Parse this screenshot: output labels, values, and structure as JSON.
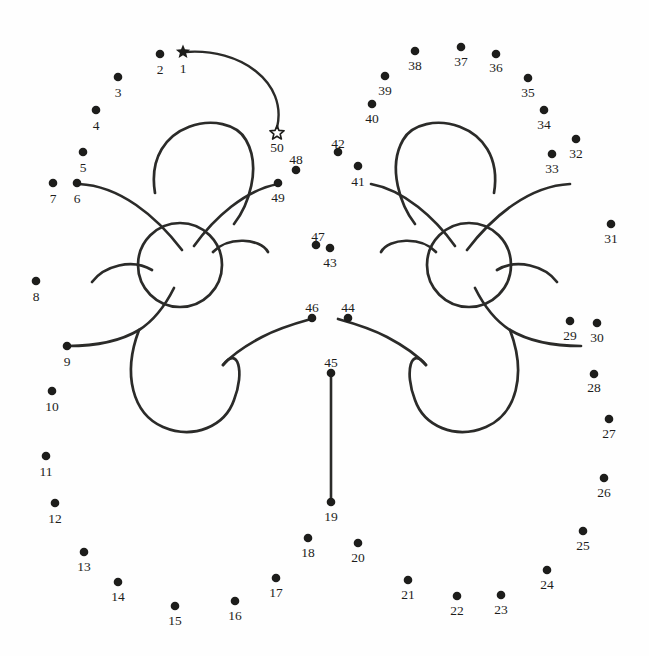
{
  "page": {
    "background_color": "#fefefe",
    "ink_color": "#1d1d1b",
    "stroke_color": "#2b2b29",
    "width": 649,
    "height": 656
  },
  "puzzle": {
    "start_marker": "filled-star",
    "end_marker": "open-star",
    "start_number": "1",
    "end_number": "50",
    "total_dots": 50,
    "dots": [
      {
        "n": "1",
        "x": 183,
        "y": 52,
        "marker": "filled-star",
        "lx": 183,
        "ly": 73
      },
      {
        "n": "2",
        "x": 160,
        "y": 54,
        "marker": "dot",
        "lx": 160,
        "ly": 74
      },
      {
        "n": "3",
        "x": 118,
        "y": 77,
        "marker": "dot",
        "lx": 118,
        "ly": 97
      },
      {
        "n": "4",
        "x": 96,
        "y": 110,
        "marker": "dot",
        "lx": 96,
        "ly": 130
      },
      {
        "n": "5",
        "x": 83,
        "y": 152,
        "marker": "dot",
        "lx": 83,
        "ly": 172
      },
      {
        "n": "6",
        "x": 77,
        "y": 183,
        "marker": "dot",
        "lx": 77,
        "ly": 203
      },
      {
        "n": "7",
        "x": 53,
        "y": 183,
        "marker": "dot",
        "lx": 53,
        "ly": 203
      },
      {
        "n": "8",
        "x": 36,
        "y": 281,
        "marker": "dot",
        "lx": 36,
        "ly": 301
      },
      {
        "n": "9",
        "x": 67,
        "y": 346,
        "marker": "dot",
        "lx": 67,
        "ly": 366
      },
      {
        "n": "10",
        "x": 52,
        "y": 391,
        "marker": "dot",
        "lx": 52,
        "ly": 411
      },
      {
        "n": "11",
        "x": 46,
        "y": 456,
        "marker": "dot",
        "lx": 46,
        "ly": 476
      },
      {
        "n": "12",
        "x": 55,
        "y": 503,
        "marker": "dot",
        "lx": 55,
        "ly": 523
      },
      {
        "n": "13",
        "x": 84,
        "y": 552,
        "marker": "dot",
        "lx": 84,
        "ly": 571
      },
      {
        "n": "14",
        "x": 118,
        "y": 582,
        "marker": "dot",
        "lx": 118,
        "ly": 601
      },
      {
        "n": "15",
        "x": 175,
        "y": 606,
        "marker": "dot",
        "lx": 175,
        "ly": 625
      },
      {
        "n": "16",
        "x": 235,
        "y": 601,
        "marker": "dot",
        "lx": 235,
        "ly": 620
      },
      {
        "n": "17",
        "x": 276,
        "y": 578,
        "marker": "dot",
        "lx": 276,
        "ly": 597
      },
      {
        "n": "18",
        "x": 308,
        "y": 538,
        "marker": "dot",
        "lx": 308,
        "ly": 557
      },
      {
        "n": "19",
        "x": 331,
        "y": 502,
        "marker": "dot",
        "lx": 331,
        "ly": 521
      },
      {
        "n": "20",
        "x": 358,
        "y": 543,
        "marker": "dot",
        "lx": 358,
        "ly": 562
      },
      {
        "n": "21",
        "x": 408,
        "y": 580,
        "marker": "dot",
        "lx": 408,
        "ly": 599
      },
      {
        "n": "22",
        "x": 457,
        "y": 596,
        "marker": "dot",
        "lx": 457,
        "ly": 615
      },
      {
        "n": "23",
        "x": 501,
        "y": 595,
        "marker": "dot",
        "lx": 501,
        "ly": 614
      },
      {
        "n": "24",
        "x": 547,
        "y": 570,
        "marker": "dot",
        "lx": 547,
        "ly": 589
      },
      {
        "n": "25",
        "x": 583,
        "y": 531,
        "marker": "dot",
        "lx": 583,
        "ly": 550
      },
      {
        "n": "26",
        "x": 604,
        "y": 478,
        "marker": "dot",
        "lx": 604,
        "ly": 497
      },
      {
        "n": "27",
        "x": 609,
        "y": 419,
        "marker": "dot",
        "lx": 609,
        "ly": 438
      },
      {
        "n": "28",
        "x": 594,
        "y": 374,
        "marker": "dot",
        "lx": 594,
        "ly": 392
      },
      {
        "n": "29",
        "x": 570,
        "y": 321,
        "marker": "dot",
        "lx": 570,
        "ly": 340
      },
      {
        "n": "30",
        "x": 597,
        "y": 323,
        "marker": "dot",
        "lx": 597,
        "ly": 342
      },
      {
        "n": "31",
        "x": 611,
        "y": 224,
        "marker": "dot",
        "lx": 611,
        "ly": 243
      },
      {
        "n": "32",
        "x": 576,
        "y": 139,
        "marker": "dot",
        "lx": 576,
        "ly": 158
      },
      {
        "n": "33",
        "x": 552,
        "y": 154,
        "marker": "dot",
        "lx": 552,
        "ly": 173
      },
      {
        "n": "34",
        "x": 544,
        "y": 110,
        "marker": "dot",
        "lx": 544,
        "ly": 129
      },
      {
        "n": "35",
        "x": 528,
        "y": 78,
        "marker": "dot",
        "lx": 528,
        "ly": 97
      },
      {
        "n": "36",
        "x": 496,
        "y": 54,
        "marker": "dot",
        "lx": 496,
        "ly": 72
      },
      {
        "n": "37",
        "x": 461,
        "y": 47,
        "marker": "dot",
        "lx": 461,
        "ly": 66
      },
      {
        "n": "38",
        "x": 415,
        "y": 51,
        "marker": "dot",
        "lx": 415,
        "ly": 70
      },
      {
        "n": "39",
        "x": 385,
        "y": 76,
        "marker": "dot",
        "lx": 385,
        "ly": 95
      },
      {
        "n": "40",
        "x": 372,
        "y": 104,
        "marker": "dot",
        "lx": 372,
        "ly": 123
      },
      {
        "n": "41",
        "x": 358,
        "y": 166,
        "marker": "dot",
        "lx": 358,
        "ly": 186
      },
      {
        "n": "42",
        "x": 338,
        "y": 152,
        "marker": "dot",
        "lx": 338,
        "ly": 148
      },
      {
        "n": "43",
        "x": 330,
        "y": 248,
        "marker": "dot",
        "lx": 330,
        "ly": 267
      },
      {
        "n": "44",
        "x": 348,
        "y": 318,
        "marker": "dot",
        "lx": 348,
        "ly": 312
      },
      {
        "n": "45",
        "x": 331,
        "y": 373,
        "marker": "dot",
        "lx": 331,
        "ly": 367
      },
      {
        "n": "46",
        "x": 312,
        "y": 318,
        "marker": "dot",
        "lx": 312,
        "ly": 312
      },
      {
        "n": "47",
        "x": 316,
        "y": 245,
        "marker": "dot",
        "lx": 318,
        "ly": 241
      },
      {
        "n": "48",
        "x": 296,
        "y": 170,
        "marker": "dot",
        "lx": 296,
        "ly": 164
      },
      {
        "n": "49",
        "x": 278,
        "y": 183,
        "marker": "dot",
        "lx": 278,
        "ly": 202
      },
      {
        "n": "50",
        "x": 277,
        "y": 133,
        "marker": "open-star",
        "lx": 277,
        "ly": 152
      }
    ],
    "connector_line": {
      "from": "45",
      "to": "19",
      "x1": 331,
      "y1": 373,
      "x2": 331,
      "y2": 502
    },
    "guide_arc": "M186,52 C240,48 288,82 277,128",
    "figures": [
      {
        "name": "left-butterfly",
        "body_circle": {
          "cx": 180,
          "cy": 265,
          "r": 42
        },
        "paths": [
          "M155,193 C143,120 228,107 246,140 C262,168 248,206 234,224",
          "M79,184 C120,186 156,216 182,250",
          "M278,184 C245,190 214,218 194,246",
          "M68,346 C95,346 119,342 139,330 C158,318 168,300 174,288",
          "M311,319 C293,324 277,329 262,337 C245,346 232,355 223,365",
          "M139,330 C122,375 133,414 163,427 C194,440 225,426 234,400 C245,372 238,345 223,365",
          "M92,282 C104,266 132,258 152,270",
          "M268,252 C260,238 228,236 213,252"
        ]
      },
      {
        "name": "right-butterfly",
        "body_circle": {
          "cx": 469,
          "cy": 265,
          "r": 42
        },
        "paths": [
          "M494,193 C506,120 421,107 403,140 C387,168 401,206 415,224",
          "M570,184 C529,186 493,216 467,250",
          "M371,184 C404,190 435,218 455,246",
          "M581,346 C554,346 530,342 510,330 C491,318 481,300 475,288",
          "M338,319 C356,324 372,329 387,337 C404,346 417,355 426,365",
          "M510,330 C527,375 516,414 486,427 C455,440 424,426 415,400 C404,372 411,345 426,365",
          "M557,282 C545,266 517,258 497,270",
          "M381,252 C389,238 421,236 436,252"
        ]
      }
    ]
  }
}
